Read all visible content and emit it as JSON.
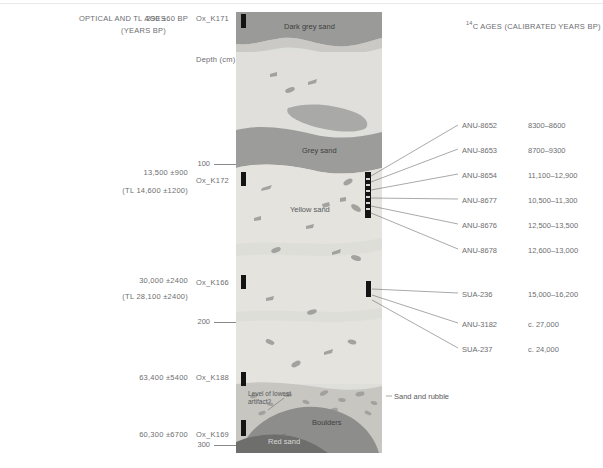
{
  "figure": {
    "header_left_line1": "OPTICAL AND TL AGES",
    "header_left_line2": "(YEARS BP)",
    "header_right": "C AGES (CALIBRATED YEARS BP)",
    "header_right_sup": "14",
    "depth_axis_label": "Depth (cm)"
  },
  "optical_ages": [
    {
      "id": "opt-0",
      "age": "290 ±60 BP",
      "tl": "",
      "code": "Ox_K171"
    },
    {
      "id": "opt-1",
      "age": "13,500 ±900",
      "tl": "(TL 14,600 ±1200)",
      "code": "Ox_K172"
    },
    {
      "id": "opt-2",
      "age": "30,000 ±2400",
      "tl": "(TL 28,100 ±2400)",
      "code": "Ox_K166"
    },
    {
      "id": "opt-3",
      "age": "63,400 ±5400",
      "tl": "",
      "code": "Ox_K188"
    },
    {
      "id": "opt-4",
      "age": "60,300 ±6700",
      "tl": "",
      "code": "Ox_K169"
    }
  ],
  "depth_ticks": [
    {
      "value": "100"
    },
    {
      "value": "200"
    },
    {
      "value": "300"
    }
  ],
  "radiocarbon_ages": [
    {
      "code": "ANU-8652",
      "range": "8300–8600"
    },
    {
      "code": "ANU-8653",
      "range": "8700–9300"
    },
    {
      "code": "ANU-8654",
      "range": "11,100–12,900"
    },
    {
      "code": "ANU-8677",
      "range": "10,500–11,300"
    },
    {
      "code": "ANU-8676",
      "range": "12,500–13,500"
    },
    {
      "code": "ANU-8678",
      "range": "12,600–13,000"
    },
    {
      "code": "SUA-236",
      "range": "15,000–16,200"
    },
    {
      "code": "ANU-3182",
      "range": "c. 27,000"
    },
    {
      "code": "SUA-237",
      "range": "c. 24,000"
    }
  ],
  "strata": [
    {
      "name": "Dark grey sand",
      "color": "#9a9a98"
    },
    {
      "name": "Grey sand",
      "color": "#9a9a98"
    },
    {
      "name": "Yellow sand",
      "color": "#e3e2dd"
    },
    {
      "name": "Sand and rubble",
      "color": "#c9c8c3"
    },
    {
      "name": "Boulders",
      "color": "#8e8e8c"
    },
    {
      "name": "Red sand",
      "color": "#6f6f6d"
    }
  ],
  "annotations": {
    "lowest_artifact": "Level of lowest artifact?",
    "sand_and_rubble": "Sand and rubble"
  },
  "colors": {
    "dark_grey_sand": "#9a9a98",
    "pale_sand": "#dededa",
    "yellow_sand": "#e4e3de",
    "grey_sand": "#9c9c9a",
    "boulders": "#8d8d8b",
    "red_sand": "#6e6e6c",
    "rubble": "#c7c6c1",
    "clast": "#9b9b99",
    "sample_bar": "#141414",
    "leader": "#6f6f6f",
    "text": "#6d6e71"
  }
}
